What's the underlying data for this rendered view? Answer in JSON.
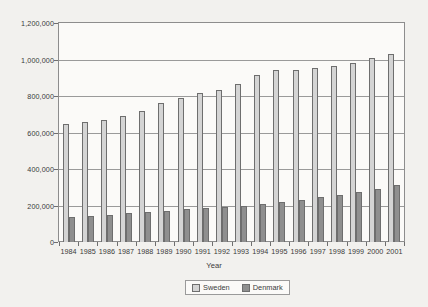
{
  "chart_data": {
    "type": "bar",
    "title": "",
    "xlabel": "Year",
    "ylabel": "",
    "ylim": [
      0,
      1200000
    ],
    "ytick_step": 200000,
    "grid": true,
    "legend_position": "bottom",
    "categories": [
      "1984",
      "1985",
      "1986",
      "1987",
      "1988",
      "1989",
      "1990",
      "1991",
      "1992",
      "1993",
      "1994",
      "1995",
      "1996",
      "1997",
      "1998",
      "1999",
      "2000",
      "2001"
    ],
    "ytick_labels": [
      "0",
      "200,000",
      "400,000",
      "600,000",
      "800,000",
      "1,000,000",
      "1,200,000"
    ],
    "ytick_values": [
      0,
      200000,
      400000,
      600000,
      800000,
      1000000,
      1200000
    ],
    "series": [
      {
        "name": "Sweden",
        "color": "#d4d4d4",
        "values": [
          645000,
          655000,
          670000,
          690000,
          720000,
          760000,
          790000,
          815000,
          835000,
          865000,
          915000,
          940000,
          945000,
          955000,
          965000,
          980000,
          1010000,
          1030000
        ]
      },
      {
        "name": "Denmark",
        "color": "#8f8f8f",
        "values": [
          135000,
          140000,
          150000,
          160000,
          167000,
          172000,
          180000,
          185000,
          190000,
          200000,
          210000,
          218000,
          230000,
          245000,
          260000,
          275000,
          290000,
          310000
        ]
      }
    ]
  },
  "legend": {
    "items": [
      {
        "label": "Sweden",
        "color": "#d4d4d4"
      },
      {
        "label": "Denmark",
        "color": "#8f8f8f"
      }
    ]
  }
}
